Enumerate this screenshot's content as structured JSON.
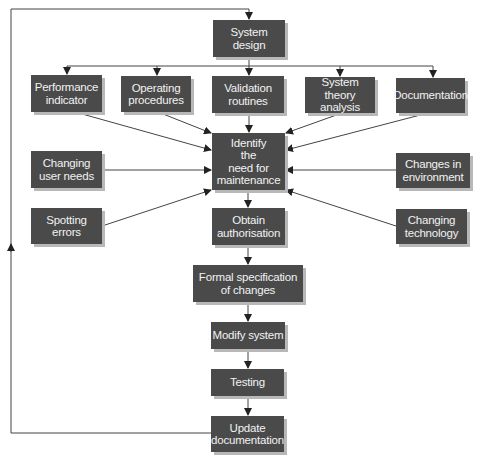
{
  "diagram": {
    "colors": {
      "box_fill": "#4a4a4a",
      "box_text": "#f2f2f2",
      "line": "#333333",
      "shadow": "#b8b8b8"
    },
    "nodes": {
      "system_design": "System\ndesign",
      "performance_indicator": "Performance\nindicator",
      "operating_procedures": "Operating\nprocedures",
      "validation_routines": "Validation\nroutines",
      "system_theory_analysis": "System theory\nanalysis",
      "documentation": "Documentation",
      "identify_need": "Identify\nthe\nneed for\nmaintenance",
      "changing_user_needs": "Changing\nuser needs",
      "changes_in_environment": "Changes in\nenvironment",
      "spotting_errors": "Spotting\nerrors",
      "obtain_authorisation": "Obtain\nauthorisation",
      "changing_technology": "Changing\ntechnology",
      "formal_specification": "Formal specification\nof changes",
      "modify_system": "Modify system",
      "testing": "Testing",
      "update_documentation": "Update\ndocumentation"
    },
    "edges": [
      [
        "system_design",
        "performance_indicator"
      ],
      [
        "system_design",
        "operating_procedures"
      ],
      [
        "system_design",
        "validation_routines"
      ],
      [
        "system_design",
        "system_theory_analysis"
      ],
      [
        "system_design",
        "documentation"
      ],
      [
        "performance_indicator",
        "identify_need"
      ],
      [
        "operating_procedures",
        "identify_need"
      ],
      [
        "validation_routines",
        "identify_need"
      ],
      [
        "system_theory_analysis",
        "identify_need"
      ],
      [
        "documentation",
        "identify_need"
      ],
      [
        "changing_user_needs",
        "identify_need"
      ],
      [
        "spotting_errors",
        "identify_need"
      ],
      [
        "changes_in_environment",
        "identify_need"
      ],
      [
        "changing_technology",
        "identify_need"
      ],
      [
        "identify_need",
        "obtain_authorisation"
      ],
      [
        "obtain_authorisation",
        "formal_specification"
      ],
      [
        "formal_specification",
        "modify_system"
      ],
      [
        "modify_system",
        "testing"
      ],
      [
        "testing",
        "update_documentation"
      ],
      [
        "update_documentation",
        "system_design"
      ]
    ]
  }
}
